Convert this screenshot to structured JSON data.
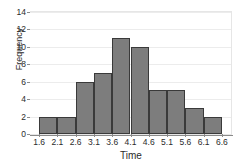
{
  "chart_data": {
    "type": "bar",
    "title": "",
    "xlabel": "Time",
    "ylabel": "Frequency",
    "categories": [
      "1.6-2.1",
      "2.1-2.6",
      "2.6-3.1",
      "3.1-3.6",
      "3.6-4.1",
      "4.1-4.6",
      "4.6-5.1",
      "5.1-5.6",
      "5.6-6.1",
      "6.1-6.6"
    ],
    "values": [
      2,
      2,
      6,
      7,
      11,
      10,
      5,
      5,
      3,
      2
    ],
    "bin_edges": [
      1.6,
      2.1,
      2.6,
      3.1,
      3.6,
      4.1,
      4.6,
      5.1,
      5.6,
      6.1,
      6.6
    ],
    "xtick_labels": [
      "1.6",
      "2.1",
      "2.6",
      "3.1",
      "3.6",
      "4.1",
      "4.6",
      "5.1",
      "5.6",
      "6.1",
      "6.6"
    ],
    "ytick_labels": [
      "0",
      "2",
      "4",
      "6",
      "8",
      "10",
      "12",
      "14"
    ],
    "ytick_values": [
      0,
      2,
      4,
      6,
      8,
      10,
      12,
      14
    ],
    "xlim": [
      1.35,
      6.85
    ],
    "ylim": [
      0,
      14
    ],
    "grid": true,
    "legend": false,
    "bar_fill_color": "#7d7d7d",
    "bar_border_color": "#3a3a3a",
    "grid_color": "#ececec",
    "axis_color": "#8a8a8a",
    "text_color": "#2b2b2b",
    "background_color": "#ffffff"
  }
}
